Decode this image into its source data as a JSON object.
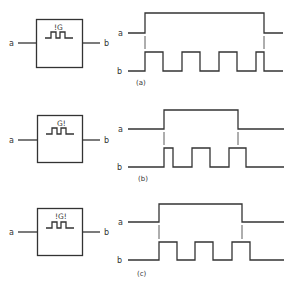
{
  "panels": [
    {
      "id": "a",
      "caption": "(a)",
      "gate_label": "!G",
      "input_label": "a",
      "output_label": "b",
      "signal_a_label": "a",
      "signal_b_label": "b"
    },
    {
      "id": "b",
      "caption": "(b)",
      "gate_label": "G!",
      "input_label": "a",
      "output_label": "b",
      "signal_a_label": "a",
      "signal_b_label": "b"
    },
    {
      "id": "c",
      "caption": "(c)",
      "gate_label": "!G!",
      "input_label": "a",
      "output_label": "b",
      "signal_a_label": "a",
      "signal_b_label": "b"
    }
  ],
  "colors": {
    "stroke": "#333333",
    "background": "#ffffff"
  }
}
